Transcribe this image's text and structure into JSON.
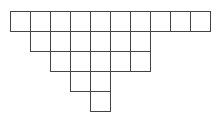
{
  "diagram": {
    "type": "skew-young-diagram",
    "cell_size": 20,
    "origin": {
      "x": 10,
      "y": 11
    },
    "line_color": "#444444",
    "rows": [
      {
        "start_col": 0,
        "length": 10
      },
      {
        "start_col": 1,
        "length": 6
      },
      {
        "start_col": 2,
        "length": 5
      },
      {
        "start_col": 3,
        "length": 2
      },
      {
        "start_col": 4,
        "length": 1
      }
    ]
  }
}
